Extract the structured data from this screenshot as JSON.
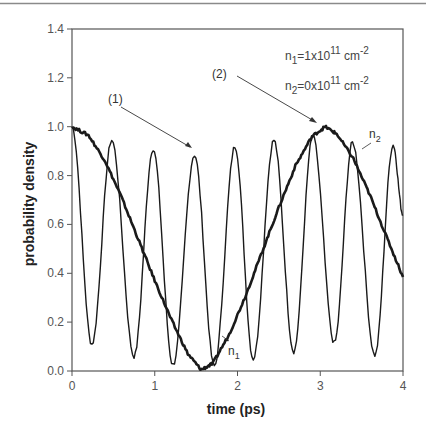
{
  "chart_data": {
    "type": "line",
    "title": "",
    "xlabel": "time (ps)",
    "ylabel": "probability density",
    "xlim": [
      0,
      4
    ],
    "ylim": [
      0,
      1.4
    ],
    "xticks": [
      "0",
      "1",
      "2",
      "3",
      "4"
    ],
    "yticks": [
      "0.0",
      "0.2",
      "0.4",
      "0.6",
      "0.8",
      "1.0",
      "1.2",
      "1.4"
    ],
    "grid": false,
    "legend_text": [
      "n1=1x10^11 cm^-2",
      "n2=0x10^11 cm^-2"
    ],
    "annotations": [
      {
        "label": "(1)",
        "points_to_t": 1.49,
        "points_to_v": 0.88
      },
      {
        "label": "(2)",
        "points_to_t": 2.97,
        "points_to_v": 0.99
      },
      {
        "label": "n1",
        "near_t": 1.6,
        "near_v": 0.08
      },
      {
        "label": "n2",
        "near_t": 3.5,
        "near_v": 0.9
      }
    ],
    "series": [
      {
        "name": "n1 (fast oscillation)",
        "stroke_width": 1.4,
        "points": [
          [
            0.0,
            1.0
          ],
          [
            0.24,
            0.11
          ],
          [
            0.48,
            0.945
          ],
          [
            0.75,
            0.06
          ],
          [
            0.98,
            0.91
          ],
          [
            1.22,
            0.025
          ],
          [
            1.48,
            0.885
          ],
          [
            1.72,
            0.02
          ],
          [
            1.97,
            0.92
          ],
          [
            2.19,
            0.05
          ],
          [
            2.44,
            0.945
          ],
          [
            2.68,
            0.08
          ],
          [
            2.91,
            0.96
          ],
          [
            3.17,
            0.115
          ],
          [
            3.39,
            0.935
          ],
          [
            3.66,
            0.065
          ],
          [
            3.88,
            0.925
          ],
          [
            4.0,
            0.64
          ]
        ]
      },
      {
        "name": "n2 (slow oscillation)",
        "stroke_width": 2.6,
        "points": [
          [
            0.0,
            1.0
          ],
          [
            0.2,
            0.965
          ],
          [
            0.4,
            0.86
          ],
          [
            0.6,
            0.71
          ],
          [
            0.8,
            0.54
          ],
          [
            1.0,
            0.37
          ],
          [
            1.2,
            0.21
          ],
          [
            1.4,
            0.07
          ],
          [
            1.56,
            0.005
          ],
          [
            1.7,
            0.03
          ],
          [
            1.9,
            0.15
          ],
          [
            2.1,
            0.31
          ],
          [
            2.3,
            0.49
          ],
          [
            2.5,
            0.67
          ],
          [
            2.7,
            0.84
          ],
          [
            2.9,
            0.96
          ],
          [
            3.06,
            1.0
          ],
          [
            3.2,
            0.97
          ],
          [
            3.4,
            0.87
          ],
          [
            3.6,
            0.72
          ],
          [
            3.8,
            0.55
          ],
          [
            4.0,
            0.385
          ]
        ]
      }
    ]
  },
  "labels": {
    "xlabel": "time (ps)",
    "ylabel": "probability density",
    "annot1": "(1)",
    "annot2": "(2)",
    "n1_label": "n",
    "n1_sub": "1",
    "n2_label": "n",
    "n2_sub": "2",
    "legend1_n": "n",
    "legend1_sub": "1",
    "legend1_val": "=1x10",
    "legend1_exp": "11",
    "legend1_unit": " cm",
    "legend1_unit_exp": "-2",
    "legend2_n": "n",
    "legend2_sub": "2",
    "legend2_val": "=0x10",
    "legend2_exp": "11",
    "legend2_unit": " cm",
    "legend2_unit_exp": "-2",
    "xticks": [
      "0",
      "1",
      "2",
      "3",
      "4"
    ],
    "yticks": [
      "0.0",
      "0.2",
      "0.4",
      "0.6",
      "0.8",
      "1.0",
      "1.2",
      "1.4"
    ]
  },
  "colors": {
    "curve": "#1a1a1a",
    "axis": "#444444",
    "top_rule": "#888888"
  }
}
